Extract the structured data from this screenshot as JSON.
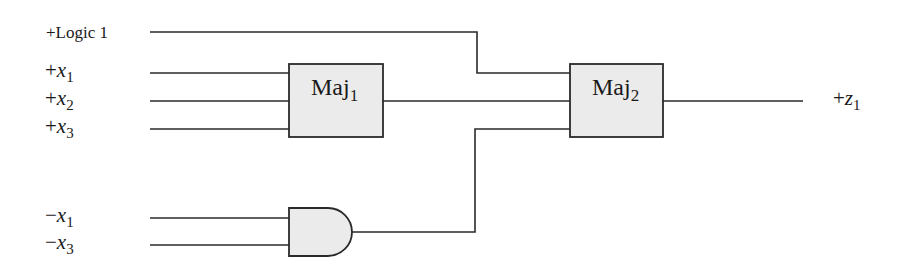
{
  "diagram": {
    "type": "logic-circuit",
    "inputs": [
      {
        "id": "logic1",
        "sign": "+",
        "text": "Logic 1",
        "var": "",
        "sub": ""
      },
      {
        "id": "x1",
        "sign": "+",
        "text": "",
        "var": "x",
        "sub": "1"
      },
      {
        "id": "x2",
        "sign": "+",
        "text": "",
        "var": "x",
        "sub": "2"
      },
      {
        "id": "x3",
        "sign": "+",
        "text": "",
        "var": "x",
        "sub": "3"
      },
      {
        "id": "nx1",
        "sign": "−",
        "text": "",
        "var": "x",
        "sub": "1"
      },
      {
        "id": "nx3",
        "sign": "−",
        "text": "",
        "var": "x",
        "sub": "3"
      }
    ],
    "blocks": [
      {
        "id": "maj1",
        "name": "Maj",
        "sub": "1",
        "inputs": [
          "+x1",
          "+x2",
          "+x3"
        ]
      },
      {
        "id": "maj2",
        "name": "Maj",
        "sub": "2",
        "inputs": [
          "+Logic 1",
          "Maj1 output",
          "AND output"
        ]
      }
    ],
    "gates": [
      {
        "id": "and1",
        "type": "AND",
        "inputs": [
          "-x1",
          "-x3"
        ]
      }
    ],
    "output": {
      "sign": "+",
      "var": "z",
      "sub": "1"
    },
    "colors": {
      "wire": "#2a2a2a",
      "block_fill": "#ebebeb",
      "background": "#ffffff"
    }
  }
}
